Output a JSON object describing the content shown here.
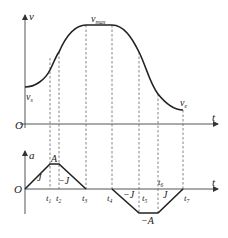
{
  "velocity_plot": {
    "y_axis_label": "v",
    "x_axis_label": "t",
    "origin_label": "O",
    "vmax_label": "v",
    "vmax_sub": "max",
    "vs_label": "v",
    "vs_sub": "s",
    "ve_label": "v",
    "ve_sub": "e"
  },
  "accel_plot": {
    "y_axis_label": "a",
    "x_axis_label": "t",
    "origin_label": "O",
    "peak_label": "A",
    "neg_peak_label": "−A",
    "jerk_labels": [
      "J",
      "−J",
      "−J",
      "J"
    ],
    "time_labels": [
      {
        "name": "t",
        "sub": "1"
      },
      {
        "name": "t",
        "sub": "2"
      },
      {
        "name": "t",
        "sub": "3"
      },
      {
        "name": "t",
        "sub": "4"
      },
      {
        "name": "t",
        "sub": "5"
      },
      {
        "name": "t",
        "sub": "6"
      },
      {
        "name": "t",
        "sub": "7"
      }
    ]
  }
}
